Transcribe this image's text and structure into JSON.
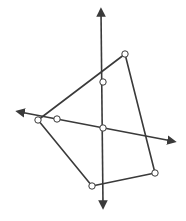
{
  "diagram": {
    "title": "",
    "colors": {
      "stroke": "#3a3a3a",
      "point_fill": "#ffffff",
      "background": "#ffffff"
    },
    "axes": {
      "vertical": {
        "from": [
          103,
          205
        ],
        "to": [
          101,
          12
        ]
      },
      "slanted": {
        "from": [
          172,
          141
        ],
        "to": [
          20,
          112
        ]
      }
    },
    "polygon": {
      "vertices": [
        [
          125,
          54
        ],
        [
          38,
          120
        ],
        [
          92,
          186
        ],
        [
          155,
          173
        ]
      ]
    },
    "points": [
      {
        "id": "top-right-vertex",
        "xy": [
          125,
          54
        ]
      },
      {
        "id": "vertical-axis-point",
        "xy": [
          103,
          82
        ]
      },
      {
        "id": "left-vertex",
        "xy": [
          38,
          120
        ]
      },
      {
        "id": "slanted-axis-point",
        "xy": [
          57,
          119
        ]
      },
      {
        "id": "intersection-point",
        "xy": [
          103,
          128
        ]
      },
      {
        "id": "bottom-vertex",
        "xy": [
          92,
          186
        ]
      },
      {
        "id": "bottom-right-vertex",
        "xy": [
          155,
          173
        ]
      }
    ]
  }
}
